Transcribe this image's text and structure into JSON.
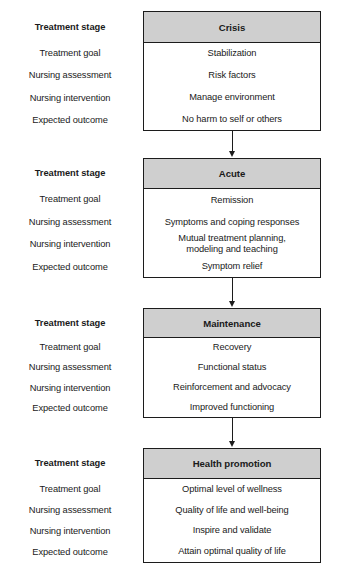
{
  "diagram": {
    "row_labels_heading": "Treatment stage",
    "row_labels": [
      "Treatment goal",
      "Nursing assessment",
      "Nursing intervention",
      "Expected outcome"
    ],
    "header_fill": "#cfcfcf",
    "border_color": "#1c1c1c",
    "stages": [
      {
        "heading": "Crisis",
        "rows": [
          "Stabilization",
          "Risk factors",
          "Manage environment",
          "No harm to self or others"
        ]
      },
      {
        "heading": "Acute",
        "rows": [
          "Remission",
          "Symptoms and coping responses",
          "Mutual treatment planning,\nmodeling and teaching",
          "Symptom relief"
        ]
      },
      {
        "heading": "Maintenance",
        "rows": [
          "Recovery",
          "Functional status",
          "Reinforcement and advocacy",
          "Improved functioning"
        ]
      },
      {
        "heading": "Health promotion",
        "rows": [
          "Optimal level of wellness",
          "Quality of life and well-being",
          "Inspire and validate",
          "Attain optimal quality of life"
        ]
      }
    ]
  }
}
